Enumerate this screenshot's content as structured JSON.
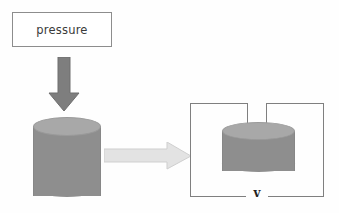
{
  "diagram": {
    "background_color": "#fefefe",
    "label_box": {
      "text": "pressure",
      "border_color": "#8d8d8d",
      "fill_color": "#ffffff",
      "text_color": "#3a3a3a"
    },
    "down_arrow": {
      "name": "pressure direction arrow",
      "direction": "down",
      "fill_color": "#7e7e7e",
      "stroke_color": "#6e6e6e"
    },
    "cylinder_before": {
      "name": "uncompressed cylinder",
      "body_color": "#8e8e8e",
      "top_color": "#a8a8a8",
      "outline_color": "#9a9a9a"
    },
    "right_arrow": {
      "name": "transition arrow",
      "direction": "right",
      "fill_color": "#e3e3e3",
      "stroke_color": "#cfcfcf"
    },
    "frame": {
      "name": "measurement bracket",
      "line_color": "#7f7f7f",
      "v_label": "v"
    },
    "cylinder_after": {
      "name": "compressed cylinder",
      "body_color": "#8e8e8e",
      "top_color": "#a8a8a8",
      "outline_color": "#9a9a9a"
    }
  }
}
